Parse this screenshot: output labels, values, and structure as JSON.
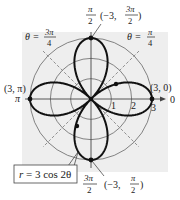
{
  "figure": {
    "equation": "r = 3 cos 2θ",
    "equation_parts": {
      "lhs": "r",
      "rhs": "= 3 cos 2θ"
    },
    "theta_lines": [
      {
        "label_prefix": "θ =",
        "num": "3π",
        "den": "4"
      },
      {
        "label_prefix": "θ =",
        "num": "π",
        "den": "4"
      }
    ],
    "axis_labels": {
      "top": {
        "num": "π",
        "den": "2"
      },
      "bottom": {
        "num": "3π",
        "den": "2"
      },
      "left": "π",
      "right": "0"
    },
    "radial_ticks": [
      "1",
      "2",
      "3"
    ],
    "points": {
      "top": {
        "text": "(−3, ",
        "num": "3π",
        "den": "2",
        "close": ")"
      },
      "bottom": {
        "text": "(−3, ",
        "num": "π",
        "den": "2",
        "close": ")"
      },
      "left": "(3, π)",
      "right": "(3, 0)"
    },
    "colors": {
      "background": "#eeeeee",
      "curve": "#111111",
      "grid": "#555555",
      "dashed": "#777777"
    }
  },
  "chart_data": {
    "type": "polar",
    "title": "",
    "equation": "r = 3 cos 2θ",
    "radial_range": [
      0,
      3
    ],
    "radial_ticks": [
      1,
      2,
      3
    ],
    "angle_labels": [
      "0",
      "π/2",
      "π",
      "3π/2"
    ],
    "dashed_lines": [
      "θ = π/4",
      "θ = 3π/4"
    ],
    "labeled_points": [
      {
        "label": "(3, 0)",
        "r": 3,
        "theta": "0"
      },
      {
        "label": "(−3, 3π/2)",
        "r": -3,
        "theta": "3π/2"
      },
      {
        "label": "(3, π)",
        "r": 3,
        "theta": "π"
      },
      {
        "label": "(−3, π/2)",
        "r": -3,
        "theta": "π/2"
      }
    ]
  }
}
